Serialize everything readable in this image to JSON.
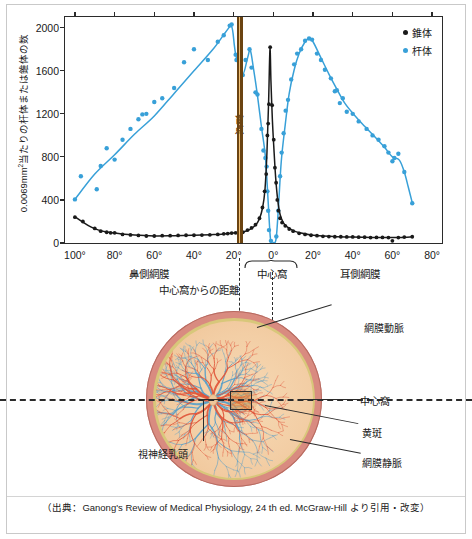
{
  "figure": {
    "caption": "（出典：Ganong's Review of Medical Physiology, 24 th ed. McGraw-Hill より引用・改変）"
  },
  "chart_data": {
    "type": "scatter",
    "title": "",
    "xlabel": "中心窩からの距離",
    "ylabel": "0.0069mm2当たりの杆体または錐体の数",
    "xlim": [
      -105,
      85
    ],
    "ylim": [
      0,
      2100
    ],
    "yticks": [
      0,
      400,
      800,
      1200,
      1600,
      2000
    ],
    "xticks": [
      -100,
      -80,
      -60,
      -40,
      -20,
      0,
      20,
      40,
      60,
      80
    ],
    "xticklabels": [
      "100°",
      "80°",
      "60°",
      "40°",
      "20°",
      "0°",
      "20°",
      "40°",
      "60°",
      "80°"
    ],
    "grid": false,
    "legend_position": "top-right",
    "legend": [
      {
        "label": "錐体",
        "color": "#1a1a1a"
      },
      {
        "label": "杆体",
        "color": "#38a0d8"
      }
    ],
    "annotations": [
      {
        "name": "blind-spot",
        "label": "盲点",
        "x_from": -18.5,
        "x_to": -15.5,
        "color": "#f2c277",
        "edge_color": "#6b4412"
      },
      {
        "name": "nasal-retina",
        "label": "鼻側網膜",
        "x": -62
      },
      {
        "name": "fovea",
        "label": "中心窩",
        "x": 0
      },
      {
        "name": "temporal-retina",
        "label": "耳側網膜",
        "x": 44
      }
    ],
    "series": [
      {
        "name": "杆体",
        "color": "#38a0d8",
        "points": [
          [
            -100,
            405
          ],
          [
            -97,
            620
          ],
          [
            -89,
            500
          ],
          [
            -87,
            715
          ],
          [
            -84,
            880
          ],
          [
            -80,
            775
          ],
          [
            -76,
            960
          ],
          [
            -72,
            1060
          ],
          [
            -68,
            1150
          ],
          [
            -66,
            1195
          ],
          [
            -64,
            1200
          ],
          [
            -60,
            1310
          ],
          [
            -56,
            1345
          ],
          [
            -50,
            1440
          ],
          [
            -45,
            1680
          ],
          [
            -40,
            1800
          ],
          [
            -33,
            1700
          ],
          [
            -28,
            1870
          ],
          [
            -25,
            1930
          ],
          [
            -22,
            2020
          ],
          [
            -21,
            2030
          ],
          [
            -19,
            1750
          ],
          [
            -18.6,
            1700
          ],
          [
            -15.4,
            1560
          ],
          [
            -14,
            1700
          ],
          [
            -12,
            1800
          ],
          [
            -11,
            1630
          ],
          [
            -9,
            1400
          ],
          [
            -8,
            1380
          ],
          [
            -6,
            1060
          ],
          [
            -5,
            860
          ],
          [
            -4,
            790
          ],
          [
            -3.4,
            710
          ],
          [
            -3,
            480
          ],
          [
            -2.6,
            300
          ],
          [
            -2.2,
            120
          ],
          [
            -1.2,
            20
          ],
          [
            1.5,
            60
          ],
          [
            2.5,
            300
          ],
          [
            3.4,
            620
          ],
          [
            4.2,
            840
          ],
          [
            5.2,
            1020
          ],
          [
            6.2,
            1230
          ],
          [
            7.4,
            1330
          ],
          [
            9,
            1520
          ],
          [
            10.5,
            1660
          ],
          [
            12,
            1760
          ],
          [
            14,
            1800
          ],
          [
            16,
            1880
          ],
          [
            18,
            1900
          ],
          [
            19.5,
            1890
          ],
          [
            22,
            1760
          ],
          [
            24,
            1700
          ],
          [
            26,
            1610
          ],
          [
            29,
            1530
          ],
          [
            31,
            1410
          ],
          [
            32,
            1420
          ],
          [
            33.5,
            1300
          ],
          [
            35,
            1345
          ],
          [
            37,
            1220
          ],
          [
            40,
            1200
          ],
          [
            43,
            1130
          ],
          [
            47,
            1060
          ],
          [
            50,
            1000
          ],
          [
            53,
            960
          ],
          [
            56,
            900
          ],
          [
            58,
            840
          ],
          [
            60,
            760
          ],
          [
            61,
            790
          ],
          [
            63,
            830
          ],
          [
            66,
            660
          ],
          [
            70,
            370
          ]
        ]
      },
      {
        "name": "錐体",
        "color": "#1a1a1a",
        "points": [
          [
            -100,
            240
          ],
          [
            -96,
            200
          ],
          [
            -90,
            135
          ],
          [
            -87,
            110
          ],
          [
            -84,
            100
          ],
          [
            -82,
            95
          ],
          [
            -80,
            95
          ],
          [
            -76,
            80
          ],
          [
            -72,
            75
          ],
          [
            -68,
            70
          ],
          [
            -64,
            65
          ],
          [
            -60,
            65
          ],
          [
            -56,
            68
          ],
          [
            -52,
            68
          ],
          [
            -48,
            70
          ],
          [
            -44,
            72
          ],
          [
            -40,
            72
          ],
          [
            -36,
            74
          ],
          [
            -32,
            76
          ],
          [
            -28,
            80
          ],
          [
            -25,
            85
          ],
          [
            -23,
            88
          ],
          [
            -21,
            92
          ],
          [
            -19,
            95
          ],
          [
            -15.4,
            100
          ],
          [
            -13,
            120
          ],
          [
            -11,
            140
          ],
          [
            -9,
            170
          ],
          [
            -7,
            230
          ],
          [
            -5.5,
            330
          ],
          [
            -4.4,
            480
          ],
          [
            -3.6,
            640
          ],
          [
            -3,
            1000
          ],
          [
            -2.6,
            1110
          ],
          [
            -2.2,
            1290
          ],
          [
            -1.6,
            1820
          ],
          [
            -0.6,
            1280
          ],
          [
            0.2,
            960
          ],
          [
            0.8,
            700
          ],
          [
            1.4,
            560
          ],
          [
            2,
            400
          ],
          [
            2.6,
            300
          ],
          [
            3.4,
            230
          ],
          [
            4.4,
            190
          ],
          [
            6,
            160
          ],
          [
            8,
            130
          ],
          [
            10,
            110
          ],
          [
            13,
            90
          ],
          [
            16,
            80
          ],
          [
            19,
            72
          ],
          [
            22,
            68
          ],
          [
            25,
            62
          ],
          [
            28,
            60
          ],
          [
            31,
            58
          ],
          [
            34,
            58
          ],
          [
            37,
            56
          ],
          [
            40,
            56
          ],
          [
            43,
            54
          ],
          [
            46,
            54
          ],
          [
            49,
            50
          ],
          [
            52,
            52
          ],
          [
            55,
            52
          ],
          [
            58,
            50
          ],
          [
            60,
            20
          ],
          [
            63,
            50
          ],
          [
            66,
            55
          ],
          [
            70,
            58
          ]
        ]
      }
    ]
  },
  "eye_diagram": {
    "name": "retina-fundus-diagram",
    "labels": {
      "retinal_artery": "網膜動脈",
      "fovea": "中心窩",
      "macula": "黄斑",
      "retinal_vein": "網膜静脈",
      "optic_disc": "視神経乳頭"
    },
    "colors": {
      "sclera_ring": "#d98b80",
      "gold_ring": "#d8c77a",
      "fundus": "#f3ce a5",
      "artery": "#e0553a",
      "vein": "#5a9fc8"
    }
  }
}
